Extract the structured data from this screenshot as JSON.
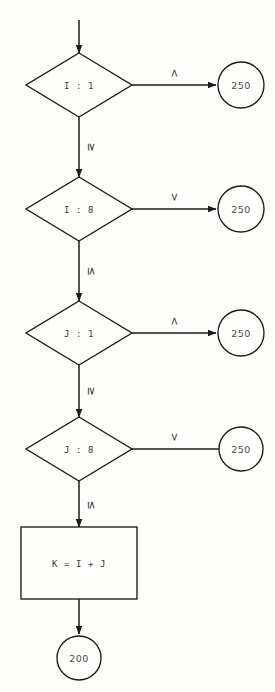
{
  "diagram": {
    "background_color": "#fdfdfb",
    "line_color": "#1a1a1a",
    "text_color": "#3a3a3a",
    "entry_arrow": "entry-arrow"
  },
  "nodes": {
    "decision_1": {
      "label": "I : 1",
      "type": "decision"
    },
    "decision_2": {
      "label": "I : 8",
      "type": "decision"
    },
    "decision_3": {
      "label": "J : 1",
      "type": "decision"
    },
    "decision_4": {
      "label": "J : 8",
      "type": "decision"
    },
    "process_1": {
      "label": "K = I + J",
      "type": "process"
    },
    "terminal_1": {
      "label": "250",
      "type": "connector-circle"
    },
    "terminal_2": {
      "label": "250",
      "type": "connector-circle"
    },
    "terminal_3": {
      "label": "250",
      "type": "connector-circle"
    },
    "terminal_4": {
      "label": "250",
      "type": "connector-circle"
    },
    "terminal_5": {
      "label": "200",
      "type": "connector-circle"
    }
  },
  "branches": {
    "b1_right": "<",
    "b1_down": "≥",
    "b2_right": ">",
    "b2_down": "≤",
    "b3_right": "<",
    "b3_down": "≥",
    "b4_right": ">",
    "b4_down": "≤"
  }
}
